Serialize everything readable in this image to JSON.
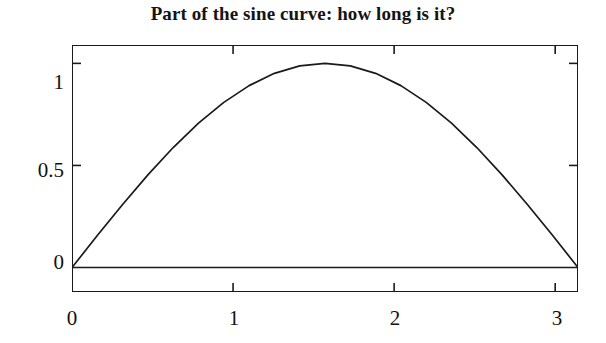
{
  "chart_data": {
    "type": "line",
    "title": "Part of the sine curve: how long is it?",
    "xlabel": "",
    "ylabel": "",
    "xlim": [
      0,
      3.1416
    ],
    "ylim": [
      -0.12,
      1.09
    ],
    "grid": false,
    "legend": null,
    "xticks": [
      0,
      1,
      2,
      3
    ],
    "xtick_labels": [
      "0",
      "1",
      "2",
      "3"
    ],
    "yticks": [
      0,
      0.5,
      1
    ],
    "ytick_labels": [
      "0",
      "0.5",
      "1"
    ],
    "series": [
      {
        "name": "sin(x)",
        "color": "#1a1a1a",
        "x": [
          0,
          0.1571,
          0.3142,
          0.4712,
          0.6283,
          0.7854,
          0.9425,
          1.0996,
          1.2566,
          1.4137,
          1.5708,
          1.7279,
          1.885,
          2.042,
          2.1991,
          2.3562,
          2.5133,
          2.6704,
          2.8274,
          2.9845,
          3.1416
        ],
        "values": [
          0,
          0.1564,
          0.309,
          0.454,
          0.5878,
          0.7071,
          0.809,
          0.891,
          0.9511,
          0.9877,
          1,
          0.9877,
          0.9511,
          0.891,
          0.809,
          0.7071,
          0.5878,
          0.454,
          0.309,
          0.1564,
          0
        ]
      },
      {
        "name": "baseline y=0",
        "color": "#1a1a1a",
        "x": [
          0,
          3.1416
        ],
        "values": [
          0,
          0
        ]
      }
    ]
  },
  "axis": {
    "tick_direction": "in",
    "frame_color": "#1a1a1a",
    "background": "#ffffff"
  }
}
